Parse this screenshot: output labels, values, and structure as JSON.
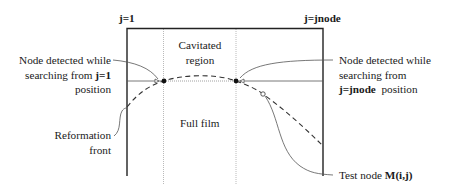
{
  "diagram": {
    "column_labels": {
      "left": "j=1",
      "right": "j=jnode"
    },
    "regions": {
      "cavitated": [
        "Cavitated",
        "region"
      ],
      "full_film": "Full film"
    },
    "annotations": {
      "left_node": {
        "line1": "Node detected while",
        "line2_prefix": "searching from ",
        "line2_bold": "j=1",
        "line3": "position"
      },
      "right_node": {
        "line1": "Node detected while",
        "line2": "searching from",
        "line3_bold": "j=jnode",
        "line3_suffix": "position"
      },
      "reformation_front": [
        "Reformation",
        "front"
      ],
      "test_node": {
        "prefix": "Test  node ",
        "bold": "M(i,j)"
      }
    },
    "colors": {
      "ink": "#1a1a1a",
      "grid": "#9a9a9a",
      "background": "#ffffff"
    }
  }
}
